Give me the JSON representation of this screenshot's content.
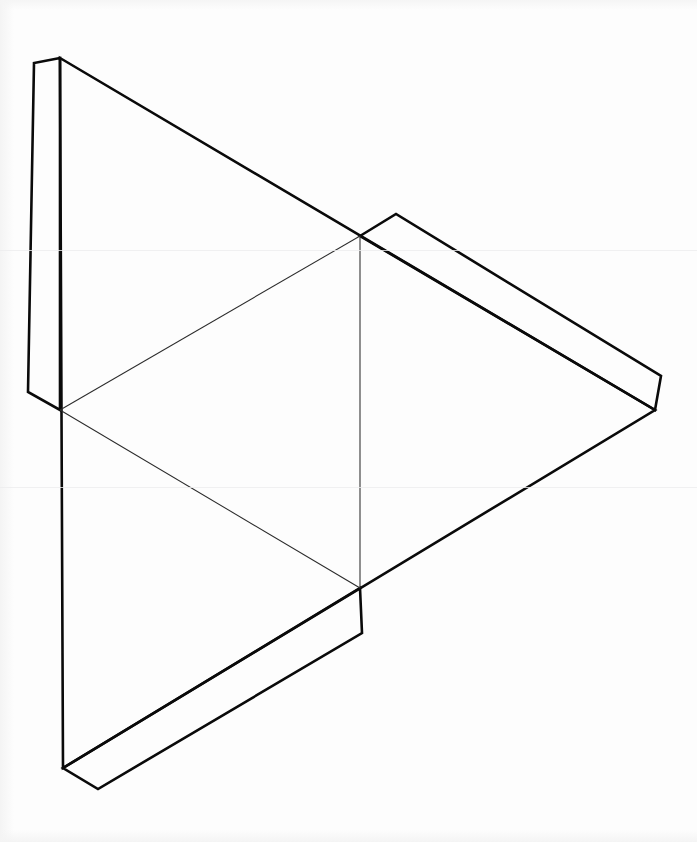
{
  "document": {
    "title": "Tetrahedron Net Template",
    "kind": "papercraft-fold-pattern",
    "canvas_width": 697,
    "canvas_height": 842,
    "background_color": "#fdfdfd",
    "cut_line_color": "#0a0a0a",
    "fold_line_color": "#2b2b2b",
    "cut_line_width": 2.6,
    "fold_line_width": 1.05
  },
  "geometry": {
    "outer_triangle": {
      "name": "outer-cut-triangle",
      "vertices": [
        {
          "id": "A",
          "label": "top-apex",
          "x": 60,
          "y": 58
        },
        {
          "id": "B",
          "label": "right-apex",
          "x": 655,
          "y": 410
        },
        {
          "id": "C",
          "label": "bottom-apex",
          "x": 63,
          "y": 768
        }
      ],
      "points_attr": "60,58 655,410 63,768"
    },
    "inner_triangle": {
      "name": "inner-fold-triangle",
      "vertices": [
        {
          "id": "M_AC",
          "label": "left-midpoint",
          "x": 60,
          "y": 410
        },
        {
          "id": "M_AB",
          "label": "upper-right-midpoint",
          "x": 360,
          "y": 236
        },
        {
          "id": "M_BC",
          "label": "lower-right-midpoint",
          "x": 360,
          "y": 588
        }
      ],
      "points_attr": "60,410 360,236 360,588"
    },
    "fold_segments": [
      {
        "id": "fold-left-to-top",
        "from": "M_AC",
        "to": "M_AB",
        "d": "M 60 410 L 360 236"
      },
      {
        "id": "fold-top-to-bottom",
        "from": "M_AB",
        "to": "M_BC",
        "d": "M 360 236 L 360 588"
      },
      {
        "id": "fold-bottom-to-left",
        "from": "M_BC",
        "to": "M_AC",
        "d": "M 360 588 L 60 410"
      }
    ],
    "tabs": [
      {
        "id": "tab-left",
        "name": "glue-tab-left",
        "edge": "A-C (left vertical edge)",
        "points_attr": "60,58 34,63 28,392 60,410",
        "corners": [
          {
            "x": 60,
            "y": 58
          },
          {
            "x": 34,
            "y": 63
          },
          {
            "x": 28,
            "y": 392
          },
          {
            "x": 60,
            "y": 410
          }
        ]
      },
      {
        "id": "tab-upper-right",
        "name": "glue-tab-upper-right",
        "edge": "A-B upper half (right-facing)",
        "points_attr": "360,236 396,214 661,376 655,410",
        "corners": [
          {
            "x": 360,
            "y": 236
          },
          {
            "x": 396,
            "y": 214
          },
          {
            "x": 661,
            "y": 376
          },
          {
            "x": 655,
            "y": 410
          }
        ]
      },
      {
        "id": "tab-lower",
        "name": "glue-tab-lower",
        "edge": "B-C lower half (bottom-facing)",
        "points_attr": "360,588 362,633 98,789 63,768",
        "corners": [
          {
            "x": 360,
            "y": 588
          },
          {
            "x": 362,
            "y": 633
          },
          {
            "x": 98,
            "y": 789
          },
          {
            "x": 63,
            "y": 768
          }
        ]
      }
    ],
    "panel_fill_path": "M 60 58 L 655 410 L 63 768 Z"
  },
  "artifacts": {
    "scan_streaks": [
      {
        "id": "streak-1",
        "y": 250
      },
      {
        "id": "streak-2",
        "y": 487
      }
    ]
  }
}
